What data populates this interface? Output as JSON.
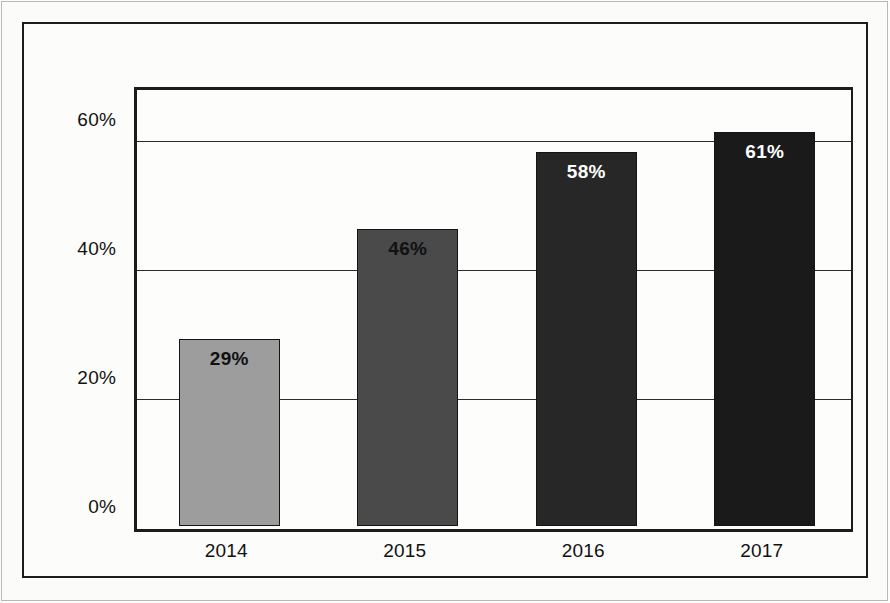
{
  "chart_data": {
    "type": "bar",
    "title": "",
    "subtitle": "",
    "xlabel": "",
    "ylabel": "",
    "categories": [
      "2014",
      "2015",
      "2016",
      "2017"
    ],
    "values": [
      29,
      46,
      58,
      61
    ],
    "value_labels": [
      "29%",
      "46%",
      "58%",
      "61%"
    ],
    "bar_colors": [
      "#9d9d9d",
      "#4a4a4a",
      "#272727",
      "#1a1a1a"
    ],
    "bar_label_colors": [
      "#111111",
      "#111111",
      "#ffffff",
      "#ffffff"
    ],
    "ylim": [
      0,
      68
    ],
    "yticks": [
      0,
      20,
      40,
      60
    ],
    "ytick_labels": [
      "0%",
      "20%",
      "40%",
      "60%"
    ],
    "gridlines": [
      20,
      40,
      60
    ],
    "grid": true,
    "legend": "none",
    "series": [
      {
        "name": "",
        "values": [
          29,
          46,
          58,
          61
        ]
      }
    ]
  },
  "frame": {
    "border_color": "#1c1c1c",
    "background": "#fcfcfb"
  }
}
